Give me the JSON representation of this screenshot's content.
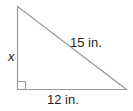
{
  "diagram": {
    "type": "right-triangle",
    "labels": {
      "vertical_leg": "x",
      "hypotenuse": "15 in.",
      "horizontal_leg": "12 in."
    },
    "right_angle_marker": "bottom-left",
    "colors": {
      "stroke": "#9a9a9a",
      "text": "#231f20"
    }
  }
}
